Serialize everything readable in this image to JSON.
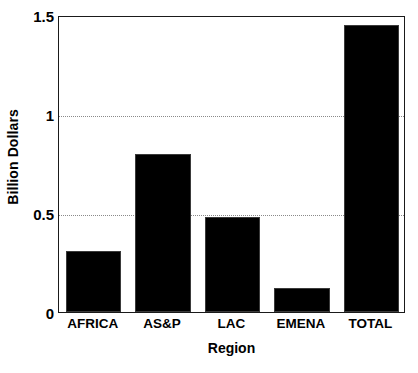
{
  "chart_data": {
    "type": "bar",
    "title": "",
    "subtitle": "",
    "xlabel": "Region",
    "ylabel": "Billion Dollars",
    "categories": [
      "AFRICA",
      "AS&P",
      "LAC",
      "EMENA",
      "TOTAL"
    ],
    "values": [
      0.31,
      0.8,
      0.48,
      0.12,
      1.45
    ],
    "series": [
      {
        "name": "Billion Dollars",
        "values": [
          0.31,
          0.8,
          0.48,
          0.12,
          1.45
        ]
      }
    ],
    "ylim": [
      0,
      1.5
    ],
    "ytick_labels": [
      "0",
      "0.5",
      "1",
      "1.5"
    ],
    "ytick_values": [
      0,
      0.5,
      1,
      1.5
    ],
    "gridlines": [
      0.5,
      1
    ],
    "grid": true,
    "legend": "none",
    "bar_color": "#000000",
    "grid_color": "#8a8a8a",
    "axis_color": "#1a1a1a",
    "background": "#ffffff"
  }
}
